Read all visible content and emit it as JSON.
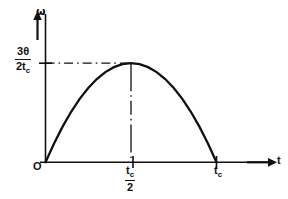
{
  "figure": {
    "background_color": "#ffffff",
    "line_color": "#101010"
  },
  "labels": {
    "y_axis": "ω",
    "x_axis": "t",
    "origin": "O",
    "y_max_numerator": "3θ",
    "y_max_denominator": "2t",
    "y_max_denominator_sub": "c",
    "x_half_numerator": "t",
    "x_half_numerator_sub": "c",
    "x_half_denominator": "2",
    "x_end": "t",
    "x_end_sub": "c"
  },
  "chart_data": {
    "type": "line",
    "title": "",
    "xlabel": "t",
    "ylabel": "ω",
    "grid": false,
    "legend": null,
    "xlim": [
      0,
      1.3
    ],
    "ylim": [
      0,
      1.18
    ],
    "x_ticks": [
      0,
      0.5,
      1.0
    ],
    "x_tick_labels": [
      "O",
      "t_c/2",
      "t_c"
    ],
    "y_ticks": [
      1.0
    ],
    "y_tick_labels": [
      "3θ/(2t_c)"
    ],
    "annotations": [
      {
        "type": "dashdot-horizontal",
        "y": 1.0,
        "from_x": 0,
        "to_x": 0.5,
        "label": "3θ/(2t_c)"
      },
      {
        "type": "dashdot-vertical",
        "x": 0.5,
        "from_y": 0,
        "to_y": 1.0,
        "label": "t_c/2"
      }
    ],
    "series": [
      {
        "name": "ω(t)",
        "equation": "ω = (6θ/t_c)(t/t_c)(1 - t/t_c)",
        "peak": {
          "x": 0.5,
          "y": 1.0
        },
        "x": [
          0.0,
          0.05,
          0.1,
          0.15,
          0.2,
          0.25,
          0.3,
          0.35,
          0.4,
          0.45,
          0.5,
          0.55,
          0.6,
          0.65,
          0.7,
          0.75,
          0.8,
          0.85,
          0.9,
          0.95,
          1.0
        ],
        "values": [
          0.0,
          0.19,
          0.36,
          0.51,
          0.64,
          0.75,
          0.84,
          0.91,
          0.96,
          0.99,
          1.0,
          0.99,
          0.96,
          0.91,
          0.84,
          0.75,
          0.64,
          0.51,
          0.36,
          0.19,
          0.0
        ]
      }
    ]
  }
}
